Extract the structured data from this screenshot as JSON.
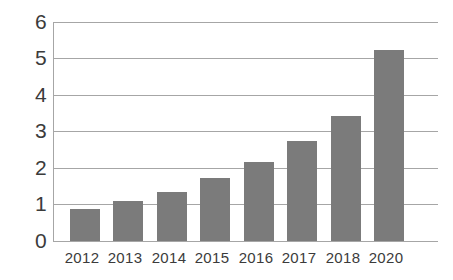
{
  "chart_data": {
    "type": "bar",
    "title": "",
    "subtitle": "",
    "xlabel": "",
    "ylabel": "",
    "categories": [
      "2012",
      "2013",
      "2014",
      "2015",
      "2016",
      "2017",
      "2018",
      "2020"
    ],
    "values": [
      0.88,
      1.1,
      1.34,
      1.73,
      2.17,
      2.74,
      3.42,
      5.22
    ],
    "series": [
      {
        "name": "",
        "values": [
          0.88,
          1.1,
          1.34,
          1.73,
          2.17,
          2.74,
          3.42,
          5.22
        ]
      }
    ],
    "ylim": [
      0,
      6
    ],
    "yticks": [
      0,
      1,
      2,
      3,
      4,
      5,
      6
    ],
    "ytick_labels": [
      "0",
      "1",
      "2",
      "3",
      "4",
      "5",
      "6"
    ],
    "grid": true,
    "grid_axis": "y",
    "legend": false,
    "legend_position": "none",
    "bar_color": "#7b7b7b",
    "grid_color": "#a6a6a6",
    "axis_color": "#a6a6a6",
    "text_color": "#3b3b3b",
    "background_color": "#ffffff",
    "annotations": []
  }
}
